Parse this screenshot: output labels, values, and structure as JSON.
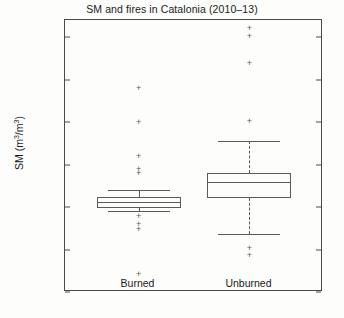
{
  "chart_data": {
    "type": "box",
    "title": "SM and fires in Catalonia (2010–13)",
    "xlabel": "",
    "ylabel": "SM (m³/m³)",
    "ylabel_base": "SM (m",
    "ylabel_sup1": "3",
    "ylabel_mid": "/m",
    "ylabel_sup2": "3",
    "ylabel_end": ")",
    "ylim": [
      0.0,
      0.32
    ],
    "ytick_values": [
      0.0,
      0.05,
      0.1,
      0.15,
      0.2,
      0.25,
      0.3
    ],
    "ytick_labels": [
      "0.00",
      "0.05",
      "0.10",
      "0.15",
      "0.20",
      "0.25",
      "0.30"
    ],
    "categories": [
      "Burned",
      "Unburned"
    ],
    "grid": false,
    "legend": "none",
    "boxes": [
      {
        "name": "Burned",
        "whisker_low": 0.0955,
        "q1": 0.099,
        "median": 0.106,
        "q3": 0.1112,
        "whisker_high": 0.1195,
        "outliers": [
          0.2405,
          0.2005,
          0.1595,
          0.145,
          0.1405,
          0.09,
          0.08,
          0.0745,
          0.021
        ]
      },
      {
        "name": "Unburned",
        "whisker_low": 0.068,
        "q1": 0.1105,
        "median": 0.129,
        "q3": 0.1395,
        "whisker_high": 0.1775,
        "outliers": [
          0.311,
          0.301,
          0.27,
          0.201,
          0.052,
          0.044
        ]
      }
    ]
  },
  "axis": {
    "ytick_labels": [
      "0.30",
      "0.25",
      "0.20",
      "0.15",
      "0.10",
      "0.05",
      "0.00"
    ],
    "xtick_labels": [
      "Burned",
      "Unburned"
    ]
  },
  "colors": {
    "frame": "#4a4a4a",
    "box": "#5a5a5a",
    "text": "#1a1a1a",
    "background": "#fdfdfc"
  }
}
